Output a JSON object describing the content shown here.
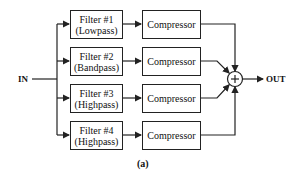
{
  "diagram": {
    "input_label": "IN",
    "output_label": "OUT",
    "summer_symbol": "+",
    "caption": "(a)",
    "branches": [
      {
        "filter_name": "Filter #1",
        "filter_type": "(Lowpass)",
        "compressor": "Compressor"
      },
      {
        "filter_name": "Filter #2",
        "filter_type": "(Bandpass)",
        "compressor": "Compressor"
      },
      {
        "filter_name": "Filter #3",
        "filter_type": "(Highpass)",
        "compressor": "Compressor"
      },
      {
        "filter_name": "Filter #4",
        "filter_type": "(Highpass)",
        "compressor": "Compressor"
      }
    ]
  }
}
